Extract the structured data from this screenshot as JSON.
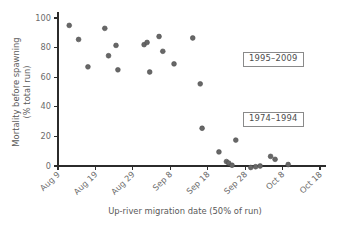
{
  "chart_data": {
    "type": "scatter",
    "title": "",
    "xlabel": "Up-river migration date (50% of run)",
    "ylabel": "Mortality before spawning (% total run)",
    "ylabel_line1": "Mortality before spawning",
    "ylabel_line2": "(% total run)",
    "ylim": [
      0,
      100
    ],
    "yticks": [
      0,
      20,
      40,
      60,
      80,
      100
    ],
    "ytick_labels": [
      "0",
      "20",
      "40",
      "60",
      "80",
      "100"
    ],
    "xlim_days": [
      0,
      70
    ],
    "xticks_days": [
      0,
      10,
      20,
      30,
      40,
      50,
      60,
      70
    ],
    "xtick_labels": [
      "Aug 9",
      "Aug 19",
      "Aug 29",
      "Sep 8",
      "Sep 18",
      "Sep 28",
      "Oct 8",
      "Oct 18"
    ],
    "grid": false,
    "legend_position": "none",
    "marker_color": "#676767",
    "marker_size_px": 4.6,
    "annotations": [
      {
        "text": "1995–2009",
        "x_day": 50.5,
        "y_value": 78
      },
      {
        "text": "1974–1994",
        "x_day": 50.5,
        "y_value": 38
      }
    ],
    "points": [
      {
        "x_day": 3.0,
        "date": "Aug 12",
        "y": 95.0
      },
      {
        "x_day": 5.5,
        "date": "Aug 14",
        "y": 85.5
      },
      {
        "x_day": 8.0,
        "date": "Aug 17",
        "y": 67.0
      },
      {
        "x_day": 12.5,
        "date": "Aug 21",
        "y": 93.0
      },
      {
        "x_day": 13.5,
        "date": "Aug 22",
        "y": 74.5
      },
      {
        "x_day": 15.5,
        "date": "Aug 24",
        "y": 81.5
      },
      {
        "x_day": 16.0,
        "date": "Aug 25",
        "y": 65.0
      },
      {
        "x_day": 23.0,
        "date": "Sep 1",
        "y": 82.0
      },
      {
        "x_day": 23.8,
        "date": "Sep 2",
        "y": 83.5
      },
      {
        "x_day": 24.5,
        "date": "Sep 2",
        "y": 63.5
      },
      {
        "x_day": 27.0,
        "date": "Sep 5",
        "y": 87.5
      },
      {
        "x_day": 28.0,
        "date": "Sep 6",
        "y": 77.5
      },
      {
        "x_day": 31.0,
        "date": "Sep 9",
        "y": 69.0
      },
      {
        "x_day": 36.0,
        "date": "Sep 14",
        "y": 86.5
      },
      {
        "x_day": 38.0,
        "date": "Sep 16",
        "y": 55.5
      },
      {
        "x_day": 38.5,
        "date": "Sep 16",
        "y": 25.5
      },
      {
        "x_day": 43.0,
        "date": "Sep 21",
        "y": 9.5
      },
      {
        "x_day": 45.0,
        "date": "Sep 23",
        "y": 3.0
      },
      {
        "x_day": 45.6,
        "date": "Sep 23",
        "y": 2.0
      },
      {
        "x_day": 46.5,
        "date": "Sep 24",
        "y": 0.5
      },
      {
        "x_day": 47.5,
        "date": "Sep 25",
        "y": 17.5
      },
      {
        "x_day": 51.5,
        "date": "Sep 29",
        "y": -1.0
      },
      {
        "x_day": 52.8,
        "date": "Oct 1",
        "y": -0.5
      },
      {
        "x_day": 54.0,
        "date": "Oct 2",
        "y": 0.0
      },
      {
        "x_day": 56.8,
        "date": "Oct 5",
        "y": 6.5
      },
      {
        "x_day": 58.0,
        "date": "Oct 6",
        "y": 4.5
      },
      {
        "x_day": 61.5,
        "date": "Oct 10",
        "y": 1.0
      }
    ]
  }
}
